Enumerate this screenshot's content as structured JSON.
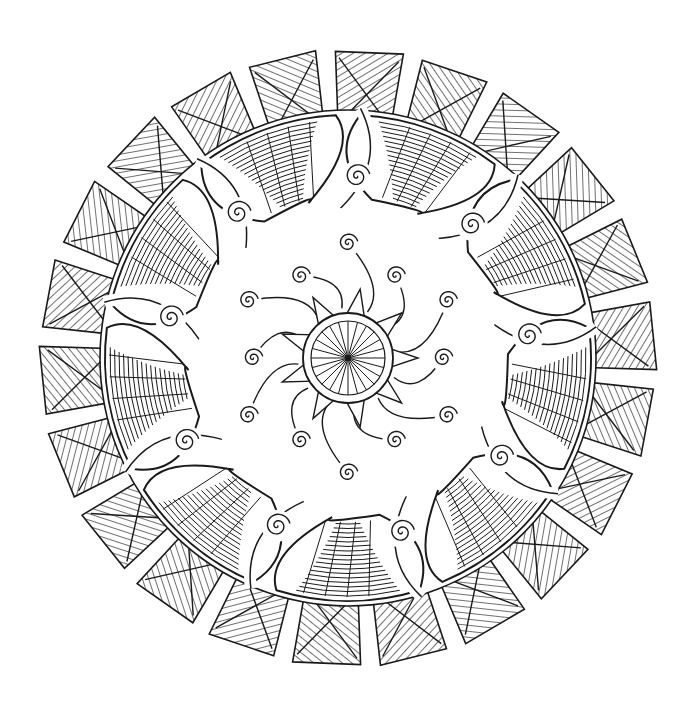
{
  "artwork": {
    "type": "mandala line art",
    "colors": {
      "background": "#ffffff",
      "line": "#1a1a1a"
    },
    "center": {
      "x": 348,
      "y": 358
    },
    "outer_rays": {
      "count": 22,
      "inner_radius": 230,
      "outer_radius": 305,
      "pattern": "chevron-x-stripes"
    },
    "wave_ring": {
      "segments": 9,
      "radius": 200,
      "band_width": 85,
      "pattern": "curved-hatching"
    },
    "spirals": {
      "ring_count": 9,
      "inner_count": 12
    },
    "core": {
      "radius": 45,
      "spokes": 24,
      "pattern": "radial-web"
    }
  }
}
